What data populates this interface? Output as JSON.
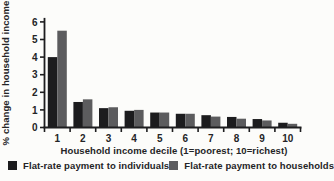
{
  "colors": {
    "background": "#fcfcfa",
    "axis": "#1d1d1f",
    "text": "#242426",
    "bar_black": "#1c1c1e",
    "bar_gray": "#5c5c5e"
  },
  "chart_data": {
    "type": "bar",
    "title": "",
    "xlabel": "Household income decile (1=poorest; 10=richest)",
    "ylabel": "% change in household income",
    "ylim": [
      0,
      6
    ],
    "yticks": [
      0,
      1,
      2,
      3,
      4,
      5,
      6
    ],
    "categories": [
      "1",
      "2",
      "3",
      "4",
      "5",
      "6",
      "7",
      "8",
      "9",
      "10"
    ],
    "series": [
      {
        "name": "Flat-rate payment to individuals",
        "color": "#1c1c1e",
        "values": [
          4.0,
          1.45,
          1.1,
          0.95,
          0.85,
          0.78,
          0.7,
          0.6,
          0.48,
          0.27
        ]
      },
      {
        "name": "Flat-rate payment to households",
        "color": "#5c5c5e",
        "values": [
          5.5,
          1.6,
          1.15,
          1.0,
          0.85,
          0.78,
          0.62,
          0.5,
          0.4,
          0.21
        ]
      }
    ],
    "grid": false,
    "legend_position": "bottom"
  }
}
